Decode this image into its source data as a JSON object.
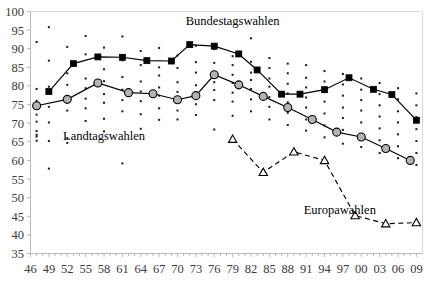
{
  "chart_data": {
    "type": "line",
    "title": "",
    "subtitle": "",
    "xlabel": "",
    "ylabel": "",
    "xlim": [
      46,
      110
    ],
    "ylim": [
      35,
      100
    ],
    "grid": false,
    "legend_position": "inline-annotations",
    "y_ticks": [
      35,
      40,
      45,
      50,
      55,
      60,
      65,
      70,
      75,
      80,
      85,
      90,
      95,
      100
    ],
    "x_tick_labels": [
      "46",
      "49",
      "52",
      "55",
      "58",
      "61",
      "64",
      "67",
      "70",
      "73",
      "76",
      "79",
      "82",
      "85",
      "88",
      "91",
      "94",
      "97",
      "00",
      "03",
      "06",
      "09"
    ],
    "x_tick_values": [
      46,
      49,
      52,
      55,
      58,
      61,
      64,
      67,
      70,
      73,
      76,
      79,
      82,
      85,
      88,
      91,
      94,
      97,
      100,
      103,
      106,
      109
    ],
    "annotations": [
      {
        "text": "Bundestagswahlen",
        "x": 79,
        "y": 96.5
      },
      {
        "text": "Landtagswahlen",
        "x": 58,
        "y": 65.5
      },
      {
        "text": "Europawahlen",
        "x": 96.5,
        "y": 45.5
      }
    ],
    "series": [
      {
        "name": "Bundestagswahlen",
        "marker": "square",
        "line": "solid",
        "color": "#000000",
        "x": [
          49,
          53,
          57,
          61,
          65,
          69,
          72,
          76,
          80,
          83,
          87,
          90,
          94,
          98,
          102,
          105,
          109
        ],
        "values": [
          78.5,
          86.0,
          87.8,
          87.7,
          86.8,
          86.7,
          91.1,
          90.7,
          88.6,
          84.3,
          77.8,
          77.8,
          79.0,
          82.2,
          79.1,
          77.7,
          70.8
        ]
      },
      {
        "name": "Landtagswahlen",
        "marker": "circle",
        "line": "solid",
        "color": "#000000",
        "x": [
          47,
          52,
          57,
          62,
          66,
          70,
          73,
          76,
          80,
          84,
          88,
          92,
          96,
          100,
          104,
          108
        ],
        "values": [
          74.7,
          76.4,
          80.8,
          78.2,
          77.9,
          76.3,
          77.4,
          83.0,
          80.3,
          77.2,
          74.2,
          71.0,
          67.6,
          66.3,
          63.2,
          60.0
        ]
      },
      {
        "name": "Europawahlen",
        "marker": "triangle",
        "line": "dashed",
        "color": "#000000",
        "x": [
          79,
          84,
          89,
          94,
          99,
          104,
          109
        ],
        "values": [
          65.7,
          56.8,
          62.3,
          60.0,
          45.2,
          43.0,
          43.3
        ]
      }
    ],
    "scatter_background": {
      "description": "individual election turnout observations",
      "marker": "small-dot",
      "points": [
        [
          47,
          91.8
        ],
        [
          47,
          79.2
        ],
        [
          47,
          76.0
        ],
        [
          47,
          74.6
        ],
        [
          47,
          72.3
        ],
        [
          47,
          70.4
        ],
        [
          47,
          67.9
        ],
        [
          47,
          66.9
        ],
        [
          47,
          66.4
        ],
        [
          47,
          65.3
        ],
        [
          49,
          95.8
        ],
        [
          49,
          86.8
        ],
        [
          49,
          79.8
        ],
        [
          49,
          74.4
        ],
        [
          49,
          70.2
        ],
        [
          49,
          65.2
        ],
        [
          49,
          57.8
        ],
        [
          52,
          90.5
        ],
        [
          52,
          83.4
        ],
        [
          52,
          80.3
        ],
        [
          52,
          76.9
        ],
        [
          52,
          73.4
        ],
        [
          52,
          66.0
        ],
        [
          52,
          64.7
        ],
        [
          55,
          93.4
        ],
        [
          55,
          88.5
        ],
        [
          55,
          82.0
        ],
        [
          55,
          79.4
        ],
        [
          55,
          76.6
        ],
        [
          55,
          74.0
        ],
        [
          55,
          70.6
        ],
        [
          58,
          90.3
        ],
        [
          58,
          84.5
        ],
        [
          58,
          81.3
        ],
        [
          58,
          77.8
        ],
        [
          58,
          75.5
        ],
        [
          58,
          71.2
        ],
        [
          58,
          67.8
        ],
        [
          61,
          93.3
        ],
        [
          61,
          86.9
        ],
        [
          61,
          82.4
        ],
        [
          61,
          79.0
        ],
        [
          61,
          76.2
        ],
        [
          61,
          73.2
        ],
        [
          61,
          59.2
        ],
        [
          64,
          89.4
        ],
        [
          64,
          85.6
        ],
        [
          64,
          81.2
        ],
        [
          64,
          78.5
        ],
        [
          64,
          75.9
        ],
        [
          64,
          72.4
        ],
        [
          64,
          68.5
        ],
        [
          67,
          90.2
        ],
        [
          67,
          85.0
        ],
        [
          67,
          82.8
        ],
        [
          67,
          79.6
        ],
        [
          67,
          77.4
        ],
        [
          67,
          74.0
        ],
        [
          67,
          70.9
        ],
        [
          70,
          88.2
        ],
        [
          70,
          84.8
        ],
        [
          70,
          81.0
        ],
        [
          70,
          78.4
        ],
        [
          70,
          76.0
        ],
        [
          70,
          73.4
        ],
        [
          70,
          71.0
        ],
        [
          73,
          90.8
        ],
        [
          73,
          86.4
        ],
        [
          73,
          83.6
        ],
        [
          73,
          80.2
        ],
        [
          73,
          78.0
        ],
        [
          73,
          75.1
        ],
        [
          73,
          72.2
        ],
        [
          76,
          89.9
        ],
        [
          76,
          86.2
        ],
        [
          76,
          83.2
        ],
        [
          76,
          81.0
        ],
        [
          76,
          78.9
        ],
        [
          76,
          76.2
        ],
        [
          76,
          68.3
        ],
        [
          79,
          88.0
        ],
        [
          79,
          85.6
        ],
        [
          79,
          83.0
        ],
        [
          79,
          80.8
        ],
        [
          79,
          78.2
        ],
        [
          79,
          75.8
        ],
        [
          79,
          72.0
        ],
        [
          82,
          92.8
        ],
        [
          82,
          86.5
        ],
        [
          82,
          83.6
        ],
        [
          82,
          81.6
        ],
        [
          82,
          79.2
        ],
        [
          82,
          76.4
        ],
        [
          82,
          73.2
        ],
        [
          85,
          87.5
        ],
        [
          85,
          84.8
        ],
        [
          85,
          82.0
        ],
        [
          85,
          79.8
        ],
        [
          85,
          77.0
        ],
        [
          85,
          74.4
        ],
        [
          85,
          71.0
        ],
        [
          88,
          86.0
        ],
        [
          88,
          83.4
        ],
        [
          88,
          80.6
        ],
        [
          88,
          78.0
        ],
        [
          88,
          75.6
        ],
        [
          88,
          72.8
        ],
        [
          88,
          69.5
        ],
        [
          91,
          85.6
        ],
        [
          91,
          82.2
        ],
        [
          91,
          79.6
        ],
        [
          91,
          76.9
        ],
        [
          91,
          74.2
        ],
        [
          91,
          71.0
        ],
        [
          91,
          68.0
        ],
        [
          94,
          84.0
        ],
        [
          94,
          81.2
        ],
        [
          94,
          78.4
        ],
        [
          94,
          75.8
        ],
        [
          94,
          72.6
        ],
        [
          94,
          69.4
        ],
        [
          94,
          66.2
        ],
        [
          97,
          83.2
        ],
        [
          97,
          80.4
        ],
        [
          97,
          77.4
        ],
        [
          97,
          74.2
        ],
        [
          97,
          71.4
        ],
        [
          97,
          68.2
        ],
        [
          97,
          64.5
        ],
        [
          100,
          82.0
        ],
        [
          100,
          79.0
        ],
        [
          100,
          76.2
        ],
        [
          100,
          73.4
        ],
        [
          100,
          70.2
        ],
        [
          100,
          67.0
        ],
        [
          100,
          63.6
        ],
        [
          103,
          80.8
        ],
        [
          103,
          77.8
        ],
        [
          103,
          74.8
        ],
        [
          103,
          71.8
        ],
        [
          103,
          68.6
        ],
        [
          103,
          65.4
        ],
        [
          103,
          62.0
        ],
        [
          106,
          79.4
        ],
        [
          106,
          76.4
        ],
        [
          106,
          73.2
        ],
        [
          106,
          70.2
        ],
        [
          106,
          67.0
        ],
        [
          106,
          63.8
        ],
        [
          106,
          60.6
        ],
        [
          109,
          78.0
        ],
        [
          109,
          74.8
        ],
        [
          109,
          71.6
        ],
        [
          109,
          68.4
        ],
        [
          109,
          65.2
        ],
        [
          109,
          62.0
        ],
        [
          109,
          58.8
        ]
      ]
    }
  }
}
